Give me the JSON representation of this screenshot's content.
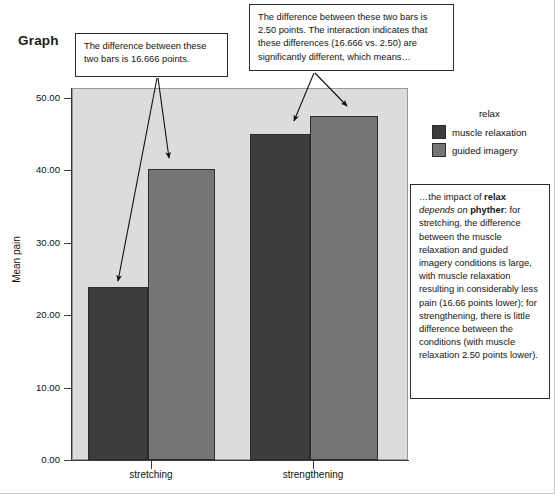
{
  "page": {
    "heading": "Graph"
  },
  "callouts": {
    "left": "The difference between these two bars is 16.666 points.",
    "top": "The difference between these two bars is 2.50 points. The interaction indicates that these differences (16.666 vs. 2.50) are significantly different, which means…",
    "right_parts": {
      "p1": "…the impact of ",
      "b1": "relax",
      "i1": " depends on ",
      "b2": "phyther",
      "p2": ": for stretching, the difference between the muscle relaxation and guided imagery conditions is large, with muscle relaxation resulting in considerably less pain (16.66 points lower); for strengthening, there is little difference between the conditions (with muscle relaxation 2.50 points lower)."
    }
  },
  "legend": {
    "title": "relax",
    "items": [
      {
        "label": "muscle relaxation",
        "color": "#3d3d3d"
      },
      {
        "label": "guided imagery",
        "color": "#757575"
      }
    ]
  },
  "colors": {
    "muscle_relaxation": "#3d3d3d",
    "guided_imagery": "#757575",
    "plot_background": "#dcdcdc",
    "axis": "#3a3a3a",
    "bar_border": "#2c2c2c"
  },
  "chart_data": {
    "type": "bar",
    "title": "Graph",
    "xlabel": "",
    "ylabel": "Mean pain",
    "categories": [
      "stretching",
      "strengthening"
    ],
    "series": [
      {
        "name": "muscle relaxation",
        "values": [
          24.42,
          46.0
        ],
        "color": "#3d3d3d"
      },
      {
        "name": "guided imagery",
        "values": [
          41.08,
          48.5
        ],
        "color": "#757575"
      }
    ],
    "ylim": [
      0,
      52.5
    ],
    "yticks": [
      0,
      10,
      20,
      30,
      40,
      50
    ],
    "ytick_labels": [
      "0.00",
      "10.00",
      "20.00",
      "30.00",
      "40.00",
      "50.00"
    ],
    "grid": false,
    "legend_position": "right",
    "annotations": [
      "The difference between these two bars is 16.666 points.",
      "The difference between these two bars is 2.50 points. The interaction indicates that these differences (16.666 vs. 2.50) are significantly different, which means…",
      "…the impact of relax depends on phyther: for stretching, the difference between the muscle relaxation and guided imagery conditions is large, with muscle relaxation resulting in considerably less pain (16.66 points lower); for strengthening, there is little difference between the conditions (with muscle relaxation 2.50 points lower)."
    ]
  }
}
